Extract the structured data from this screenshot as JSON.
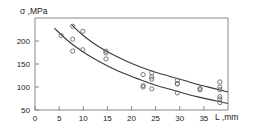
{
  "chart_data": {
    "type": "scatter",
    "title": "",
    "xlabel": "L ,mm",
    "ylabel": "σ ,MPa",
    "xlim": [
      0,
      40
    ],
    "ylim": [
      50,
      250
    ],
    "grid": false,
    "legend": "none",
    "xticks": [
      0,
      5,
      10,
      15,
      20,
      25,
      30,
      35
    ],
    "xtick_labels": [
      "0",
      "5",
      "10",
      "15",
      "20",
      "25",
      "30",
      "35"
    ],
    "yticks": [
      50,
      100,
      150,
      200
    ],
    "ytick_labels": [
      "50",
      "100",
      "150",
      "200"
    ],
    "series": [
      {
        "name": "upper",
        "marker": "open-circle",
        "points": [
          {
            "x": 7.8,
            "y": 232
          },
          {
            "x": 9.9,
            "y": 221
          },
          {
            "x": 9.9,
            "y": 181
          },
          {
            "x": 14.7,
            "y": 178
          },
          {
            "x": 14.7,
            "y": 174
          },
          {
            "x": 22.4,
            "y": 127
          },
          {
            "x": 24.2,
            "y": 131
          },
          {
            "x": 24.2,
            "y": 122
          },
          {
            "x": 24.2,
            "y": 117
          },
          {
            "x": 29.5,
            "y": 114
          },
          {
            "x": 29.5,
            "y": 107
          },
          {
            "x": 34.2,
            "y": 97
          },
          {
            "x": 38.3,
            "y": 111
          },
          {
            "x": 38.3,
            "y": 100
          },
          {
            "x": 38.3,
            "y": 94
          }
        ],
        "fit_curve": [
          {
            "x": 7.5,
            "y": 236
          },
          {
            "x": 10,
            "y": 212
          },
          {
            "x": 13,
            "y": 189
          },
          {
            "x": 16,
            "y": 171
          },
          {
            "x": 19,
            "y": 156
          },
          {
            "x": 22,
            "y": 143
          },
          {
            "x": 25,
            "y": 132
          },
          {
            "x": 28,
            "y": 123
          },
          {
            "x": 31,
            "y": 114
          },
          {
            "x": 34,
            "y": 105
          },
          {
            "x": 37,
            "y": 97
          },
          {
            "x": 40,
            "y": 89
          }
        ]
      },
      {
        "name": "lower",
        "marker": "open-circle",
        "points": [
          {
            "x": 5.4,
            "y": 212
          },
          {
            "x": 7.8,
            "y": 204
          },
          {
            "x": 7.8,
            "y": 178
          },
          {
            "x": 14.7,
            "y": 161
          },
          {
            "x": 22.4,
            "y": 103
          },
          {
            "x": 22.4,
            "y": 100
          },
          {
            "x": 24.2,
            "y": 96
          },
          {
            "x": 29.5,
            "y": 107
          },
          {
            "x": 29.5,
            "y": 87
          },
          {
            "x": 34.2,
            "y": 94
          },
          {
            "x": 38.3,
            "y": 79
          },
          {
            "x": 38.3,
            "y": 74
          },
          {
            "x": 38.3,
            "y": 66
          }
        ],
        "fit_curve": [
          {
            "x": 4,
            "y": 228
          },
          {
            "x": 7,
            "y": 199
          },
          {
            "x": 10,
            "y": 176
          },
          {
            "x": 13,
            "y": 157
          },
          {
            "x": 16,
            "y": 141
          },
          {
            "x": 19,
            "y": 127
          },
          {
            "x": 22,
            "y": 115
          },
          {
            "x": 25,
            "y": 104
          },
          {
            "x": 28,
            "y": 95
          },
          {
            "x": 31,
            "y": 86
          },
          {
            "x": 34,
            "y": 78
          },
          {
            "x": 37,
            "y": 71
          },
          {
            "x": 40,
            "y": 64
          }
        ]
      }
    ]
  }
}
